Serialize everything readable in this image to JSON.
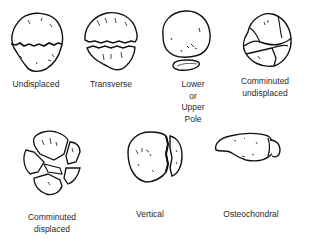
{
  "diagram": {
    "type": "fracture-classification",
    "items": [
      {
        "id": "undisplaced",
        "label_lines": [
          "Undisplaced"
        ]
      },
      {
        "id": "transverse",
        "label_lines": [
          "Transverse"
        ]
      },
      {
        "id": "pole",
        "label_lines": [
          "Lower",
          "or",
          "Upper",
          "Pole"
        ]
      },
      {
        "id": "comminuted-undisplaced",
        "label_lines": [
          "Comminuted",
          "undisplaced"
        ]
      },
      {
        "id": "comminuted-displaced",
        "label_lines": [
          "Comminuted",
          "displaced"
        ]
      },
      {
        "id": "vertical",
        "label_lines": [
          "Vertical"
        ]
      },
      {
        "id": "osteochondral",
        "label_lines": [
          "Osteochondral"
        ]
      }
    ],
    "colors": {
      "ink": "#111111",
      "background": "#ffffff",
      "text": "#2a2a2a"
    }
  }
}
